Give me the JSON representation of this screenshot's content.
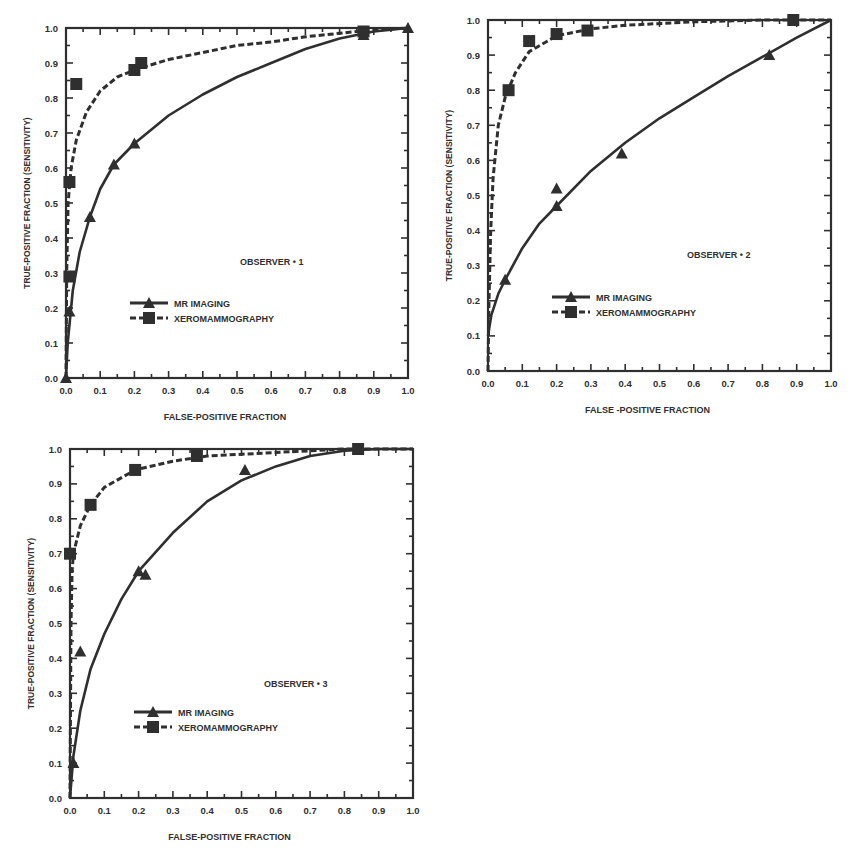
{
  "colors": {
    "ink": "#2f2f2f",
    "background": "#ffffff"
  },
  "chart_data": [
    {
      "type": "line",
      "title": "OBSERVER #1",
      "annotation": "OBSERVER • 1",
      "xlabel": "FALSE-POSITIVE FRACTION",
      "ylabel": "TRUE-POSITIVE FRACTION (SENSITIVITY)",
      "xlim": [
        0,
        1
      ],
      "ylim": [
        0,
        1
      ],
      "xticks": [
        "0.0",
        "0.1",
        "0.2",
        "0.3",
        "0.4",
        "0.5",
        "0.6",
        "0.7",
        "0.8",
        "0.9",
        "1.0"
      ],
      "yticks": [
        "0.0",
        "0.1",
        "0.2",
        "0.3",
        "0.4",
        "0.5",
        "0.6",
        "0.7",
        "0.8",
        "0.9",
        "1.0"
      ],
      "grid": false,
      "legend": {
        "position": "lower-center",
        "entries": [
          "MR IMAGING",
          "XEROMAMMOGRAPHY"
        ]
      },
      "series": [
        {
          "name": "MR IMAGING",
          "style": "solid",
          "marker": "triangle",
          "points": [
            [
              0.0,
              0.0
            ],
            [
              0.01,
              0.19
            ],
            [
              0.07,
              0.46
            ],
            [
              0.14,
              0.61
            ],
            [
              0.2,
              0.67
            ],
            [
              0.87,
              0.98
            ],
            [
              1.0,
              1.0
            ]
          ],
          "curve": [
            [
              0,
              0
            ],
            [
              0.005,
              0.1
            ],
            [
              0.02,
              0.25
            ],
            [
              0.04,
              0.36
            ],
            [
              0.07,
              0.46
            ],
            [
              0.1,
              0.54
            ],
            [
              0.14,
              0.61
            ],
            [
              0.2,
              0.67
            ],
            [
              0.3,
              0.75
            ],
            [
              0.4,
              0.81
            ],
            [
              0.5,
              0.86
            ],
            [
              0.6,
              0.9
            ],
            [
              0.7,
              0.94
            ],
            [
              0.8,
              0.97
            ],
            [
              0.9,
              0.99
            ],
            [
              1,
              1
            ]
          ]
        },
        {
          "name": "XEROMAMMOGRAPHY",
          "style": "dashed",
          "marker": "square",
          "points": [
            [
              0.01,
              0.29
            ],
            [
              0.01,
              0.56
            ],
            [
              0.03,
              0.84
            ],
            [
              0.2,
              0.88
            ],
            [
              0.22,
              0.9
            ],
            [
              0.87,
              0.99
            ]
          ],
          "curve": [
            [
              0,
              0
            ],
            [
              0.002,
              0.3
            ],
            [
              0.006,
              0.5
            ],
            [
              0.015,
              0.6
            ],
            [
              0.03,
              0.68
            ],
            [
              0.06,
              0.76
            ],
            [
              0.1,
              0.82
            ],
            [
              0.15,
              0.86
            ],
            [
              0.2,
              0.88
            ],
            [
              0.3,
              0.91
            ],
            [
              0.4,
              0.93
            ],
            [
              0.5,
              0.95
            ],
            [
              0.6,
              0.96
            ],
            [
              0.7,
              0.975
            ],
            [
              0.8,
              0.985
            ],
            [
              0.9,
              0.995
            ],
            [
              1,
              1
            ]
          ]
        }
      ]
    },
    {
      "type": "line",
      "title": "OBSERVER #2",
      "annotation": "OBSERVER • 2",
      "xlabel": "FALSE -POSITIVE FRACTION",
      "ylabel": "TRUE-POSITIVE FRACTION (SENSITIVITY)",
      "xlim": [
        0,
        1
      ],
      "ylim": [
        0,
        1
      ],
      "xticks": [
        "0.0",
        "0.1",
        "0.2",
        "0.3",
        "0.4",
        "0.5",
        "0.6",
        "0.7",
        "0.8",
        "0.9",
        "1.0"
      ],
      "yticks": [
        "0.0",
        "0.1",
        "0.2",
        "0.3",
        "0.4",
        "0.5",
        "0.6",
        "0.7",
        "0.8",
        "0.9",
        "1.0"
      ],
      "grid": false,
      "legend": {
        "position": "lower-center",
        "entries": [
          "MR IMAGING",
          "XEROMAMMOGRAPHY"
        ]
      },
      "series": [
        {
          "name": "MR IMAGING",
          "style": "solid",
          "marker": "triangle",
          "points": [
            [
              0.05,
              0.26
            ],
            [
              0.2,
              0.52
            ],
            [
              0.2,
              0.47
            ],
            [
              0.39,
              0.62
            ],
            [
              0.82,
              0.9
            ]
          ],
          "curve": [
            [
              0,
              0.1
            ],
            [
              0.01,
              0.16
            ],
            [
              0.03,
              0.22
            ],
            [
              0.05,
              0.26
            ],
            [
              0.1,
              0.35
            ],
            [
              0.15,
              0.42
            ],
            [
              0.2,
              0.47
            ],
            [
              0.3,
              0.57
            ],
            [
              0.4,
              0.65
            ],
            [
              0.5,
              0.72
            ],
            [
              0.6,
              0.78
            ],
            [
              0.7,
              0.84
            ],
            [
              0.8,
              0.895
            ],
            [
              0.9,
              0.95
            ],
            [
              1,
              1
            ]
          ]
        },
        {
          "name": "XEROMAMMOGRAPHY",
          "style": "dashed",
          "marker": "square",
          "points": [
            [
              0.06,
              0.8
            ],
            [
              0.12,
              0.94
            ],
            [
              0.2,
              0.96
            ],
            [
              0.29,
              0.97
            ],
            [
              0.89,
              1.0
            ]
          ],
          "curve": [
            [
              0,
              0
            ],
            [
              0.003,
              0.2
            ],
            [
              0.008,
              0.4
            ],
            [
              0.015,
              0.55
            ],
            [
              0.03,
              0.7
            ],
            [
              0.05,
              0.78
            ],
            [
              0.08,
              0.85
            ],
            [
              0.12,
              0.91
            ],
            [
              0.2,
              0.955
            ],
            [
              0.3,
              0.975
            ],
            [
              0.4,
              0.985
            ],
            [
              0.6,
              0.995
            ],
            [
              0.8,
              1.0
            ],
            [
              1,
              1
            ]
          ]
        }
      ]
    },
    {
      "type": "line",
      "title": "OBSERVER #3",
      "annotation": "OBSERVER • 3",
      "xlabel": "FALSE-POSITIVE FRACTION",
      "ylabel": "TRUE-POSITIVE FRACTION (SENSITIVITY)",
      "xlim": [
        0,
        1
      ],
      "ylim": [
        0,
        1
      ],
      "xticks": [
        "0.0",
        "0.1",
        "0.2",
        "0.3",
        "0.4",
        "0.5",
        "0.6",
        "0.7",
        "0.8",
        "0.9",
        "1.0"
      ],
      "yticks": [
        "0.0",
        "0.1",
        "0.2",
        "0.3",
        "0.4",
        "0.5",
        "0.6",
        "0.7",
        "0.8",
        "0.9",
        "1.0"
      ],
      "grid": false,
      "legend": {
        "position": "lower-center",
        "entries": [
          "MR IMAGING",
          "XEROMAMMOGRAPHY"
        ]
      },
      "series": [
        {
          "name": "MR IMAGING",
          "style": "solid",
          "marker": "triangle",
          "points": [
            [
              0.01,
              0.1
            ],
            [
              0.03,
              0.42
            ],
            [
              0.2,
              0.65
            ],
            [
              0.22,
              0.64
            ],
            [
              0.51,
              0.94
            ],
            [
              0.84,
              1.0
            ]
          ],
          "curve": [
            [
              0,
              0
            ],
            [
              0.01,
              0.12
            ],
            [
              0.03,
              0.25
            ],
            [
              0.06,
              0.37
            ],
            [
              0.1,
              0.47
            ],
            [
              0.15,
              0.57
            ],
            [
              0.2,
              0.65
            ],
            [
              0.3,
              0.76
            ],
            [
              0.4,
              0.85
            ],
            [
              0.5,
              0.91
            ],
            [
              0.6,
              0.95
            ],
            [
              0.7,
              0.98
            ],
            [
              0.8,
              0.995
            ],
            [
              0.9,
              1.0
            ],
            [
              1,
              1
            ]
          ]
        },
        {
          "name": "XEROMAMMOGRAPHY",
          "style": "dashed",
          "marker": "square",
          "points": [
            [
              0.0,
              0.7
            ],
            [
              0.06,
              0.84
            ],
            [
              0.19,
              0.94
            ],
            [
              0.37,
              0.98
            ],
            [
              0.84,
              1.0
            ]
          ],
          "curve": [
            [
              0,
              0
            ],
            [
              0.003,
              0.5
            ],
            [
              0.006,
              0.65
            ],
            [
              0.01,
              0.7
            ],
            [
              0.03,
              0.78
            ],
            [
              0.06,
              0.84
            ],
            [
              0.1,
              0.89
            ],
            [
              0.19,
              0.94
            ],
            [
              0.3,
              0.965
            ],
            [
              0.4,
              0.98
            ],
            [
              0.6,
              0.99
            ],
            [
              0.8,
              1.0
            ],
            [
              1,
              1
            ]
          ]
        }
      ]
    }
  ]
}
